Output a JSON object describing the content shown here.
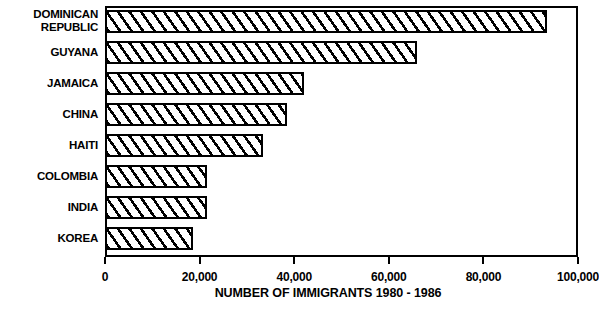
{
  "chart_data": {
    "type": "bar",
    "orientation": "horizontal",
    "title": "",
    "xlabel": "NUMBER OF IMMIGRANTS 1980 - 1986",
    "ylabel": "",
    "xlim": [
      0,
      100000
    ],
    "grid": false,
    "legend": "none",
    "categories": [
      "DOMINICAN\nREPUBLIC",
      "GUYANA",
      "JAMAICA",
      "CHINA",
      "HAITI",
      "COLOMBIA",
      "INDIA",
      "KOREA"
    ],
    "values": [
      93500,
      66000,
      42000,
      38500,
      33500,
      21500,
      21500,
      18500
    ],
    "xticks": [
      0,
      20000,
      40000,
      60000,
      80000,
      100000
    ],
    "xtick_labels": [
      "0",
      "20,000",
      "40,000",
      "60,000",
      "80,000",
      "100,000"
    ],
    "bar_style": {
      "fill": "#ffffff",
      "hatch": "diagonal-forward-slash",
      "edge_color": "#000000"
    }
  }
}
